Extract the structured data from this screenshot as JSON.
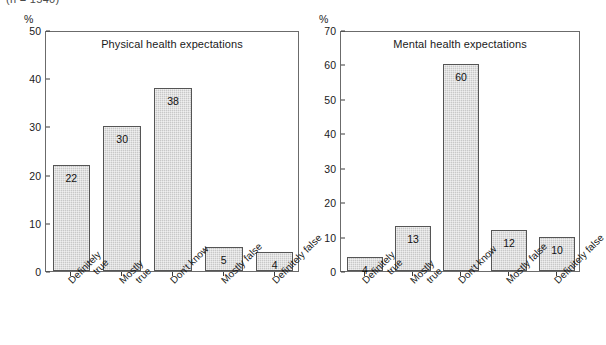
{
  "top_caption": "(n = 1540)",
  "axis_unit_label": "%",
  "chart_data": [
    {
      "id": "physical",
      "type": "bar",
      "title": "Physical health expectations",
      "categories": [
        "Definitely true",
        "Mostly true",
        "Don't know",
        "Mostly false",
        "Definitely false"
      ],
      "category_lines": [
        [
          "Definitely",
          "true"
        ],
        [
          "Mostly",
          "true"
        ],
        [
          "Don't know"
        ],
        [
          "Mostly false"
        ],
        [
          "Definitely false"
        ]
      ],
      "values": [
        22,
        30,
        38,
        5,
        4
      ],
      "value_labels": [
        "22",
        "30",
        "38",
        "5",
        "4"
      ],
      "xlabel": "",
      "ylabel": "%",
      "ylim": [
        0,
        50
      ],
      "yticks": [
        0,
        10,
        20,
        30,
        40,
        50
      ],
      "ytick_labels": [
        "0",
        "10",
        "20",
        "30",
        "40",
        "50"
      ],
      "grid": false,
      "legend": "none",
      "bar_color": "#c8c8c8",
      "bar_border_color": "#555555"
    },
    {
      "id": "mental",
      "type": "bar",
      "title": "Mental health expectations",
      "categories": [
        "Definitely true",
        "Mostly true",
        "Don't know",
        "Mostly false",
        "Definitely false"
      ],
      "category_lines": [
        [
          "Definitely",
          "true"
        ],
        [
          "Mostly",
          "true"
        ],
        [
          "Don't know"
        ],
        [
          "Mostly false"
        ],
        [
          "Definitely false"
        ]
      ],
      "values": [
        4,
        13,
        60,
        12,
        10
      ],
      "value_labels": [
        "4",
        "13",
        "60",
        "12",
        "10"
      ],
      "xlabel": "",
      "ylabel": "%",
      "ylim": [
        0,
        70
      ],
      "yticks": [
        0,
        10,
        20,
        30,
        40,
        50,
        60,
        70
      ],
      "ytick_labels": [
        "0",
        "10",
        "20",
        "30",
        "40",
        "50",
        "60",
        "70"
      ],
      "grid": false,
      "legend": "none",
      "bar_color": "#c8c8c8",
      "bar_border_color": "#555555"
    }
  ]
}
